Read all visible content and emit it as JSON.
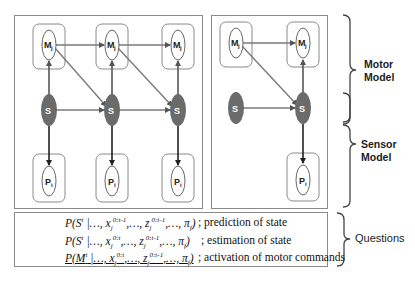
{
  "diagram": {
    "left_panel": {
      "columns": [
        {
          "motor": "M",
          "motor_sub": "j",
          "state": "S",
          "sensor": "P",
          "sensor_sub": "i"
        },
        {
          "motor": "M",
          "motor_sub": "j",
          "state": "S",
          "sensor": "P",
          "sensor_sub": "i"
        },
        {
          "motor": "M",
          "motor_sub": "j",
          "state": "S",
          "sensor": "P",
          "sensor_sub": "i"
        }
      ]
    },
    "right_panel": {
      "columns": [
        {
          "motor": "M",
          "motor_sub": "j",
          "state": "S"
        },
        {
          "motor": "M",
          "motor_sub": "j",
          "state": "S",
          "sensor": "P",
          "sensor_sub": "i"
        }
      ]
    },
    "brace_labels": {
      "motor_model": [
        "Motor",
        "Model"
      ],
      "sensor_model": [
        "Sensor",
        "Model"
      ],
      "questions": "Questions"
    },
    "colors": {
      "state_node_fill": "#6b6b6b",
      "edge_color": "#7a7a7a",
      "border_color": "#8a8a8a",
      "text_color": "#222222"
    }
  },
  "questions": [
    {
      "formula_main": "P(S",
      "formula_sup": "t",
      "x_sup": "0:t-1",
      "z_sup": "0:t-1",
      "pi_sub": "f",
      "description": "; prediction of state"
    },
    {
      "formula_main": "P(S",
      "formula_sup": "t",
      "x_sup": "0:t",
      "z_sup": "0:t-1",
      "pi_sub": "f",
      "description": "; estimation of state"
    },
    {
      "formula_main": "P(M",
      "formula_sup": "t",
      "x_sup": "0:t",
      "z_sup": "0:t-1",
      "pi_sub": "f",
      "description": "; activation of motor commands"
    }
  ]
}
